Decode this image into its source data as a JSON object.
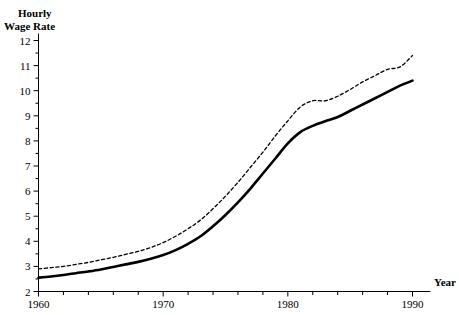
{
  "chart_data": {
    "type": "line",
    "title": "Hourly Wage Rate",
    "title_line1": "Hourly",
    "title_line2": "Wage Rate",
    "xlabel": "Year",
    "ylabel": "Hourly Wage Rate",
    "xlim": [
      1960,
      1990
    ],
    "ylim": [
      2,
      12
    ],
    "grid": false,
    "legend_position": "none",
    "x_ticks_major": [
      1960,
      1970,
      1980,
      1990
    ],
    "x_tick_labels": [
      "1960",
      "1970",
      "1980",
      "1990"
    ],
    "x_ticks_minor": [
      1962,
      1964,
      1966,
      1968,
      1972,
      1974,
      1976,
      1978,
      1982,
      1984,
      1986,
      1988
    ],
    "y_ticks_major": [
      2,
      3,
      4,
      5,
      6,
      7,
      8,
      9,
      10,
      11,
      12
    ],
    "y_tick_labels": [
      "2",
      "3",
      "4",
      "5",
      "6",
      "7",
      "8",
      "9",
      "10",
      "11",
      "12"
    ],
    "y_ticks_minor": [
      2.5,
      3.5,
      4.5,
      5.5,
      6.5,
      7.5,
      8.5,
      9.5,
      10.5,
      11.5
    ],
    "x": [
      1960,
      1961,
      1962,
      1963,
      1964,
      1965,
      1966,
      1967,
      1968,
      1969,
      1970,
      1971,
      1972,
      1973,
      1974,
      1975,
      1976,
      1977,
      1978,
      1979,
      1980,
      1981,
      1982,
      1983,
      1984,
      1985,
      1986,
      1987,
      1988,
      1989,
      1990
    ],
    "series": [
      {
        "name": "solid-curve",
        "style": "solid",
        "color": "#000000",
        "width": 2.6,
        "values": [
          2.55,
          2.6,
          2.66,
          2.73,
          2.8,
          2.88,
          2.98,
          3.08,
          3.18,
          3.3,
          3.45,
          3.65,
          3.9,
          4.2,
          4.6,
          5.05,
          5.55,
          6.1,
          6.7,
          7.3,
          7.9,
          8.35,
          8.6,
          8.78,
          8.95,
          9.2,
          9.45,
          9.7,
          9.95,
          10.2,
          10.4
        ]
      },
      {
        "name": "dashed-curve",
        "style": "dashed",
        "color": "#000000",
        "width": 1.3,
        "values": [
          2.9,
          2.95,
          3.0,
          3.08,
          3.16,
          3.26,
          3.36,
          3.48,
          3.6,
          3.75,
          3.95,
          4.2,
          4.5,
          4.85,
          5.3,
          5.8,
          6.35,
          6.95,
          7.55,
          8.2,
          8.8,
          9.35,
          9.6,
          9.6,
          9.78,
          10.05,
          10.35,
          10.6,
          10.85,
          10.95,
          11.4
        ]
      }
    ]
  },
  "axes": {
    "y_axis_title_line1": "Hourly",
    "y_axis_title_line2": "Wage Rate",
    "x_axis_title": "Year"
  }
}
